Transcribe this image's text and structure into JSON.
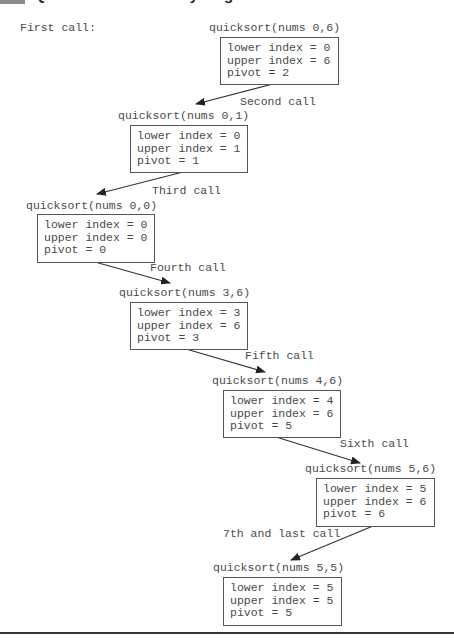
{
  "heading": {
    "text": "Quicksort recursion by diagram"
  },
  "intro_label": "First call:",
  "calls": [
    {
      "label": "quicksort(nums 0,6)",
      "lines": [
        "lower index = 0",
        "upper index = 6",
        "pivot = 2"
      ]
    },
    {
      "arrow_label": "Second call",
      "label": "quicksort(nums 0,1)",
      "lines": [
        "lower index = 0",
        "upper index = 1",
        "pivot = 1"
      ]
    },
    {
      "arrow_label": "Third call",
      "label": "quicksort(nums 0,0)",
      "lines": [
        "lower index = 0",
        "upper index = 0",
        "pivot = 0"
      ]
    },
    {
      "arrow_label": "Fourth call",
      "label": "quicksort(nums 3,6)",
      "lines": [
        "lower index = 3",
        "upper index = 6",
        "pivot = 3"
      ]
    },
    {
      "arrow_label": "Fifth call",
      "label": "quicksort(nums 4,6)",
      "lines": [
        "lower index = 4",
        "upper index = 6",
        "pivot = 5"
      ]
    },
    {
      "arrow_label": "Sixth call",
      "label": "quicksort(nums 5,6)",
      "lines": [
        "lower index = 5",
        "upper index = 6",
        "pivot = 6"
      ]
    },
    {
      "arrow_label": "7th and last call",
      "label": "quicksort(nums 5,5)",
      "lines": [
        "lower index = 5",
        "upper index = 5",
        "pivot = 5"
      ]
    }
  ],
  "colors": {
    "text": "#4a4a4a",
    "box_border": "#555555",
    "arrow": "#333333",
    "heading_block": "#8a8a8a"
  }
}
